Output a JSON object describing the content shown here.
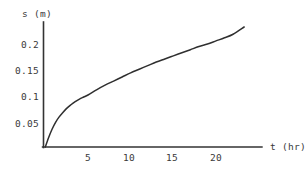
{
  "figure": {
    "background_color": "#ffffff",
    "line_color": "#2f2f2f",
    "axis_color": "#333333",
    "text_color": "#3a3a3a"
  },
  "chart_data": {
    "type": "line",
    "title": "",
    "subtitle": "",
    "xlabel": "t (hr)",
    "ylabel": "s (m)",
    "xlim": [
      0,
      25
    ],
    "ylim": [
      0,
      0.245
    ],
    "grid": false,
    "legend": false,
    "legend_position": "none",
    "x_ticks": [
      5,
      10,
      15,
      20
    ],
    "x_tick_labels": [
      "5",
      "10",
      "15",
      "20"
    ],
    "y_ticks": [
      0.05,
      0.1,
      0.15,
      0.2
    ],
    "y_tick_labels": [
      "0.05",
      "0.1",
      "0.15",
      "0.2"
    ],
    "series": [
      {
        "name": "s(t)",
        "x": [
          0,
          0.4,
          0.8,
          1.2,
          1.6,
          2.0,
          2.5,
          3.0,
          3.5,
          4.0,
          4.5,
          5.0,
          6.0,
          7.0,
          8.0,
          9.0,
          10.0,
          11.0,
          12.0,
          13.0,
          14.0,
          15.0,
          16.0,
          17.0,
          18.0,
          19.0,
          20.0,
          21.0,
          22.0,
          23.3
        ],
        "y": [
          0.0,
          0.019,
          0.035,
          0.048,
          0.058,
          0.066,
          0.075,
          0.082,
          0.088,
          0.093,
          0.097,
          0.101,
          0.111,
          0.12,
          0.128,
          0.136,
          0.144,
          0.151,
          0.158,
          0.165,
          0.171,
          0.177,
          0.183,
          0.189,
          0.195,
          0.2,
          0.206,
          0.212,
          0.219,
          0.233
        ]
      }
    ],
    "annotations": []
  }
}
